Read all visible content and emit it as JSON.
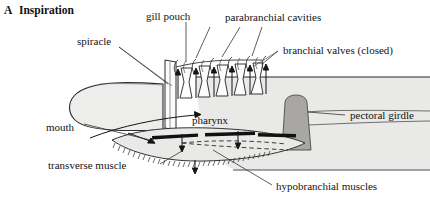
{
  "figure": {
    "panel_letter": "A",
    "panel_title": "Inspiration",
    "background_color": "#ffffff",
    "ink_color": "#141414",
    "body_fill": "#e8e8e6",
    "girdle_fill": "#a8a6a2",
    "valve_fill": "#111111"
  },
  "labels": {
    "spiracle": "spiracle",
    "gill_pouch": "gill pouch",
    "parabranchial_cavities": "parabranchial cavities",
    "branchial_valves": "branchial valves (closed)",
    "pectoral_girdle": "pectoral girdle",
    "pharynx": "pharynx",
    "mouth": "mouth",
    "transverse_muscle": "transverse muscle",
    "hypobranchial_muscles": "hypobranchial muscles"
  },
  "flow_arrows": {
    "gill_slit_arrow_count": 6,
    "gill_slit_direction": "up",
    "floor_arrow_count": 3,
    "floor_direction": "down",
    "mouth_inflow_direction": "right-into-pharynx"
  }
}
